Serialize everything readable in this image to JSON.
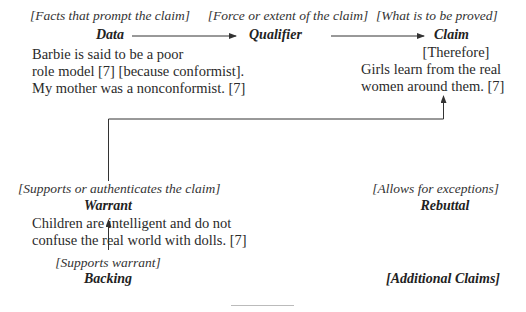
{
  "data_node": {
    "hint": "[Facts that prompt the claim]",
    "term": "Data",
    "text": [
      "Barbie is said to be a poor",
      "role model [7] [because conformist].",
      "My mother was a nonconformist. [7]"
    ]
  },
  "qualifier_node": {
    "hint": "[Force or extent of the claim]",
    "term": "Qualifier"
  },
  "claim_node": {
    "hint": "[What is to be proved]",
    "term": "Claim",
    "connector": "[Therefore]",
    "text": [
      "Girls learn from the real",
      "women around them. [7]"
    ]
  },
  "warrant_node": {
    "hint": "[Supports or authenticates the claim]",
    "term": "Warrant",
    "text": [
      "Children are intelligent and do not",
      "confuse the real world with dolls. [7]"
    ]
  },
  "rebuttal_node": {
    "hint": "[Allows for exceptions]",
    "term": "Rebuttal"
  },
  "backing_node": {
    "hint": "[Supports warrant]",
    "term": "Backing"
  },
  "additional_claims": {
    "label": "[Additional Claims]"
  },
  "colors": {
    "text": "#2a2a2a",
    "lines": "#333333",
    "footnote_rule": "#bbbbbb"
  }
}
